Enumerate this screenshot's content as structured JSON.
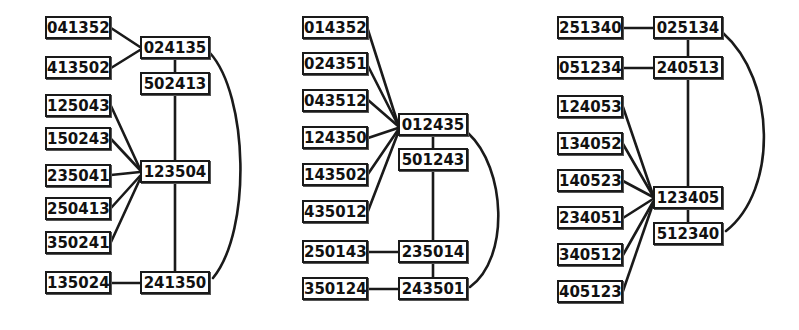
{
  "figure": {
    "type": "diagram",
    "background_color": "#ffffff",
    "node_border_color": "#1a1a1a",
    "edge_color": "#1a1a1a",
    "panel_count": 3
  },
  "panels": [
    {
      "id": "panel-left",
      "left_column": [
        {
          "label": "041352",
          "x": 45,
          "y": 16,
          "w": 66,
          "h": 23
        },
        {
          "label": "413502",
          "x": 45,
          "y": 56,
          "w": 66,
          "h": 23
        },
        {
          "label": "125043",
          "x": 45,
          "y": 94,
          "w": 66,
          "h": 23
        },
        {
          "label": "150243",
          "x": 45,
          "y": 127,
          "w": 66,
          "h": 23
        },
        {
          "label": "235041",
          "x": 45,
          "y": 164,
          "w": 66,
          "h": 23
        },
        {
          "label": "250413",
          "x": 45,
          "y": 197,
          "w": 66,
          "h": 23
        },
        {
          "label": "350241",
          "x": 45,
          "y": 231,
          "w": 66,
          "h": 23
        },
        {
          "label": "135024",
          "x": 45,
          "y": 271,
          "w": 66,
          "h": 23
        }
      ],
      "right_column": [
        {
          "label": "024135",
          "x": 140,
          "y": 36,
          "w": 70,
          "h": 23
        },
        {
          "label": "502413",
          "x": 140,
          "y": 72,
          "w": 70,
          "h": 23
        },
        {
          "label": "123504",
          "x": 140,
          "y": 160,
          "w": 70,
          "h": 23
        },
        {
          "label": "241350",
          "x": 140,
          "y": 271,
          "w": 70,
          "h": 23
        }
      ]
    },
    {
      "id": "panel-middle",
      "left_column": [
        {
          "label": "014352",
          "x": 302,
          "y": 16,
          "w": 66,
          "h": 23
        },
        {
          "label": "024351",
          "x": 302,
          "y": 52,
          "w": 66,
          "h": 23
        },
        {
          "label": "043512",
          "x": 302,
          "y": 89,
          "w": 66,
          "h": 23
        },
        {
          "label": "124350",
          "x": 302,
          "y": 126,
          "w": 66,
          "h": 23
        },
        {
          "label": "143502",
          "x": 302,
          "y": 163,
          "w": 66,
          "h": 23
        },
        {
          "label": "435012",
          "x": 302,
          "y": 200,
          "w": 66,
          "h": 23
        },
        {
          "label": "250143",
          "x": 302,
          "y": 240,
          "w": 66,
          "h": 23
        },
        {
          "label": "350124",
          "x": 302,
          "y": 277,
          "w": 66,
          "h": 23
        }
      ],
      "right_column": [
        {
          "label": "012435",
          "x": 398,
          "y": 113,
          "w": 70,
          "h": 23
        },
        {
          "label": "501243",
          "x": 398,
          "y": 148,
          "w": 70,
          "h": 23
        },
        {
          "label": "235014",
          "x": 398,
          "y": 240,
          "w": 70,
          "h": 23
        },
        {
          "label": "243501",
          "x": 398,
          "y": 277,
          "w": 70,
          "h": 23
        }
      ]
    },
    {
      "id": "panel-right",
      "left_column": [
        {
          "label": "251340",
          "x": 557,
          "y": 16,
          "w": 66,
          "h": 23
        },
        {
          "label": "051234",
          "x": 557,
          "y": 56,
          "w": 66,
          "h": 23
        },
        {
          "label": "124053",
          "x": 557,
          "y": 95,
          "w": 66,
          "h": 23
        },
        {
          "label": "134052",
          "x": 557,
          "y": 132,
          "w": 66,
          "h": 23
        },
        {
          "label": "140523",
          "x": 557,
          "y": 169,
          "w": 66,
          "h": 23
        },
        {
          "label": "234051",
          "x": 557,
          "y": 206,
          "w": 66,
          "h": 23
        },
        {
          "label": "340512",
          "x": 557,
          "y": 243,
          "w": 66,
          "h": 23
        },
        {
          "label": "405123",
          "x": 557,
          "y": 280,
          "w": 66,
          "h": 23
        }
      ],
      "right_column": [
        {
          "label": "025134",
          "x": 653,
          "y": 16,
          "w": 70,
          "h": 23
        },
        {
          "label": "240513",
          "x": 653,
          "y": 56,
          "w": 70,
          "h": 23
        },
        {
          "label": "123405",
          "x": 653,
          "y": 186,
          "w": 70,
          "h": 23
        },
        {
          "label": "512340",
          "x": 653,
          "y": 222,
          "w": 70,
          "h": 23
        }
      ]
    }
  ],
  "edges": {
    "panel_left": [
      {
        "from": "041352",
        "to": "024135"
      },
      {
        "from": "413502",
        "to": "024135"
      },
      {
        "from": "024135",
        "to": "502413"
      },
      {
        "from": "502413",
        "to": "123504"
      },
      {
        "from": "125043",
        "to": "123504"
      },
      {
        "from": "150243",
        "to": "123504"
      },
      {
        "from": "235041",
        "to": "123504"
      },
      {
        "from": "250413",
        "to": "123504"
      },
      {
        "from": "350241",
        "to": "123504"
      },
      {
        "from": "123504",
        "to": "241350"
      },
      {
        "from": "135024",
        "to": "241350"
      },
      {
        "from": "024135",
        "to": "241350",
        "curved": true
      }
    ],
    "panel_middle": [
      {
        "from": "014352",
        "to": "012435"
      },
      {
        "from": "024351",
        "to": "012435"
      },
      {
        "from": "043512",
        "to": "012435"
      },
      {
        "from": "124350",
        "to": "012435"
      },
      {
        "from": "143502",
        "to": "012435"
      },
      {
        "from": "435012",
        "to": "012435"
      },
      {
        "from": "012435",
        "to": "501243"
      },
      {
        "from": "501243",
        "to": "235014"
      },
      {
        "from": "250143",
        "to": "235014"
      },
      {
        "from": "235014",
        "to": "243501"
      },
      {
        "from": "350124",
        "to": "243501"
      },
      {
        "from": "012435",
        "to": "243501",
        "curved": true
      }
    ],
    "panel_right": [
      {
        "from": "251340",
        "to": "025134"
      },
      {
        "from": "051234",
        "to": "240513"
      },
      {
        "from": "025134",
        "to": "240513"
      },
      {
        "from": "240513",
        "to": "123405"
      },
      {
        "from": "124053",
        "to": "123405"
      },
      {
        "from": "134052",
        "to": "123405"
      },
      {
        "from": "140523",
        "to": "123405"
      },
      {
        "from": "234051",
        "to": "123405"
      },
      {
        "from": "340512",
        "to": "123405"
      },
      {
        "from": "405123",
        "to": "123405"
      },
      {
        "from": "123405",
        "to": "512340"
      },
      {
        "from": "025134",
        "to": "512340",
        "curved": true
      }
    ]
  }
}
